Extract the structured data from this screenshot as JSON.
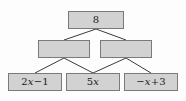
{
  "diagram": {
    "type": "number-pyramid",
    "title": "",
    "background_color": "#fdfdfd",
    "node_fill_color": "#d2d2d2",
    "node_border_color": "#7a7a7a",
    "edge_color": "#3a3a3a",
    "levels": [
      {
        "level": 1,
        "nodes": [
          {
            "id": "root",
            "label": "8",
            "empty": false
          }
        ]
      },
      {
        "level": 2,
        "nodes": [
          {
            "id": "mid-left",
            "label": "",
            "empty": true
          },
          {
            "id": "mid-right",
            "label": "",
            "empty": true
          }
        ]
      },
      {
        "level": 3,
        "nodes": [
          {
            "id": "leaf-1",
            "label": "2x−1",
            "empty": false
          },
          {
            "id": "leaf-2",
            "label": "5x",
            "empty": false
          },
          {
            "id": "leaf-3",
            "label": "−x+3",
            "empty": false
          }
        ]
      }
    ],
    "edges": [
      {
        "from": "root",
        "to": "mid-left"
      },
      {
        "from": "root",
        "to": "mid-right"
      },
      {
        "from": "mid-left",
        "to": "leaf-1"
      },
      {
        "from": "mid-left",
        "to": "leaf-2"
      },
      {
        "from": "mid-right",
        "to": "leaf-2"
      },
      {
        "from": "mid-right",
        "to": "leaf-3"
      }
    ]
  },
  "expressions": {
    "root_value": "8",
    "leaf_1": {
      "coefficient": "2",
      "variable": "x",
      "operator": "−",
      "constant": "1"
    },
    "leaf_2": {
      "coefficient": "5",
      "variable": "x"
    },
    "leaf_3": {
      "sign": "−",
      "variable": "x",
      "operator": "+",
      "constant": "3"
    }
  }
}
